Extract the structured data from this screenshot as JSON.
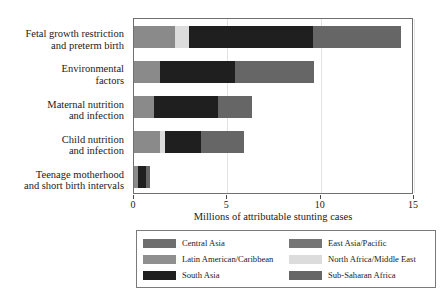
{
  "chart_data": {
    "type": "bar",
    "orientation": "horizontal",
    "stacked": true,
    "title": "",
    "xlabel": "Millions of attributable stunting cases",
    "ylabel": "",
    "xlim": [
      0,
      15
    ],
    "xticks": [
      0,
      5,
      10,
      15
    ],
    "xtick_labels": [
      "0",
      "5",
      "10",
      "15"
    ],
    "grid": true,
    "grid_axis": "x",
    "legend_position": "below",
    "categories": [
      "Fetal growth restriction\nand preterm birth",
      "Environmental\nfactors",
      "Maternal nutrition\nand infection",
      "Child nutrition\nand infection",
      "Teenage motherhood\nand short birth intervals"
    ],
    "series": [
      {
        "name": "Central Asia",
        "color": "#6e6e6e",
        "values": [
          0.05,
          0.04,
          0.04,
          0.05,
          0.02
        ]
      },
      {
        "name": "Latin American/Caribbean",
        "color": "#8f8f8f",
        "values": [
          0.1,
          0.08,
          0.06,
          0.08,
          0.03
        ]
      },
      {
        "name": "South Asia",
        "color": "#1f1f1f",
        "values": [
          6.7,
          4.0,
          3.45,
          1.9,
          0.45
        ]
      },
      {
        "name": "East Asia/Pacific",
        "color": "#8a8a8a",
        "values": [
          2.05,
          1.28,
          0.95,
          1.27,
          0.15
        ]
      },
      {
        "name": "North Africa/Middle East",
        "color": "#dcdcdc",
        "values": [
          0.7,
          0.0,
          0.0,
          0.3,
          0.0
        ]
      },
      {
        "name": "Sub-Saharan Africa",
        "color": "#666666",
        "values": [
          4.7,
          4.25,
          1.8,
          2.3,
          0.2
        ]
      }
    ],
    "bar_totals": [
      14.3,
      9.65,
      6.3,
      5.9,
      0.85
    ],
    "bar_segments": [
      [
        {
          "series": "East Asia/Pacific",
          "color": "#8a8a8a",
          "start": 0.0,
          "end": 2.2
        },
        {
          "series": "North Africa/Middle East",
          "color": "#dcdcdc",
          "start": 2.2,
          "end": 2.95
        },
        {
          "series": "South Asia",
          "color": "#1f1f1f",
          "start": 2.95,
          "end": 9.6
        },
        {
          "series": "Sub-Saharan Africa",
          "color": "#666666",
          "start": 9.6,
          "end": 14.3
        }
      ],
      [
        {
          "series": "East Asia/Pacific",
          "color": "#8a8a8a",
          "start": 0.0,
          "end": 1.38
        },
        {
          "series": "South Asia",
          "color": "#1f1f1f",
          "start": 1.38,
          "end": 5.4
        },
        {
          "series": "Sub-Saharan Africa",
          "color": "#666666",
          "start": 5.4,
          "end": 9.65
        }
      ],
      [
        {
          "series": "East Asia/Pacific",
          "color": "#8a8a8a",
          "start": 0.0,
          "end": 1.05
        },
        {
          "series": "South Asia",
          "color": "#1f1f1f",
          "start": 1.05,
          "end": 4.5
        },
        {
          "series": "Sub-Saharan Africa",
          "color": "#666666",
          "start": 4.5,
          "end": 6.3
        }
      ],
      [
        {
          "series": "East Asia/Pacific",
          "color": "#8a8a8a",
          "start": 0.0,
          "end": 1.38
        },
        {
          "series": "North Africa/Middle East",
          "color": "#dcdcdc",
          "start": 1.38,
          "end": 1.68
        },
        {
          "series": "South Asia",
          "color": "#1f1f1f",
          "start": 1.68,
          "end": 3.6
        },
        {
          "series": "Sub-Saharan Africa",
          "color": "#666666",
          "start": 3.6,
          "end": 5.9
        }
      ],
      [
        {
          "series": "East Asia/Pacific",
          "color": "#8a8a8a",
          "start": 0.0,
          "end": 0.2
        },
        {
          "series": "South Asia",
          "color": "#1f1f1f",
          "start": 0.2,
          "end": 0.65
        },
        {
          "series": "Sub-Saharan Africa",
          "color": "#666666",
          "start": 0.65,
          "end": 0.85
        }
      ]
    ],
    "legend_entries": [
      {
        "label": "Central Asia",
        "color": "#6e6e6e",
        "column": 0,
        "row": 0
      },
      {
        "label": "Latin American/Caribbean",
        "color": "#8f8f8f",
        "column": 0,
        "row": 1
      },
      {
        "label": "South Asia",
        "color": "#1f1f1f",
        "column": 0,
        "row": 2
      },
      {
        "label": "East Asia/Pacific",
        "color": "#757575",
        "column": 1,
        "row": 0
      },
      {
        "label": "North Africa/Middle East",
        "color": "#dcdcdc",
        "column": 1,
        "row": 1
      },
      {
        "label": "Sub-Saharan Africa",
        "color": "#666666",
        "column": 1,
        "row": 2
      }
    ]
  }
}
